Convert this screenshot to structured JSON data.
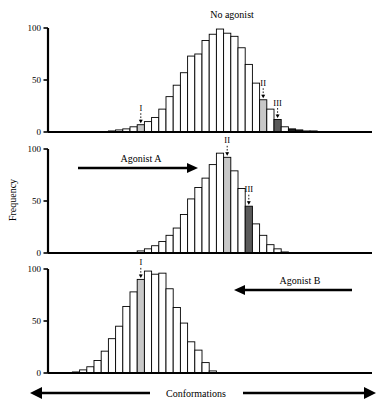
{
  "figure": {
    "yaxis_label": "Frequency",
    "xaxis_label": "Conformations",
    "ytick_labels": [
      "0",
      "50",
      "100"
    ],
    "ytick_values": [
      0,
      50,
      100
    ],
    "colors": {
      "bar_outline": "#000000",
      "bar_fill": "#ffffff",
      "state_I_fill": "#c8c8c8",
      "state_II_fill": "#c8c8c8",
      "state_III_fill": "#5a5a5a",
      "axis": "#000000"
    }
  },
  "chart_data": [
    {
      "type": "bar",
      "title": "No agonist",
      "panel": 1,
      "xlabel": "Conformations",
      "ylabel": "Frequency",
      "ylim": [
        0,
        100
      ],
      "grid": false,
      "legend": null,
      "bin_index": [
        0,
        1,
        2,
        3,
        4,
        5,
        6,
        7,
        8,
        9,
        10,
        11,
        12,
        13,
        14,
        15,
        16,
        17,
        18,
        19,
        20,
        21,
        22,
        23,
        24,
        25,
        26,
        27,
        28,
        29,
        30,
        31
      ],
      "values": [
        0,
        0,
        0,
        0,
        0,
        0,
        0,
        1,
        2,
        3,
        5,
        7,
        10,
        14,
        22,
        34,
        45,
        57,
        73,
        75,
        88,
        94,
        99,
        95,
        92,
        81,
        65,
        47,
        31,
        22,
        12,
        5
      ],
      "annotations": [
        {
          "label": "I",
          "bin": 11,
          "state": "I",
          "fill": "#c8c8c8"
        },
        {
          "label": "II",
          "bin": 28,
          "state": "II",
          "fill": "#c8c8c8"
        },
        {
          "label": "III",
          "bin": 30,
          "state": "III",
          "fill": "#5a5a5a"
        }
      ],
      "tail_values": [
        3,
        2,
        1,
        1,
        0
      ]
    },
    {
      "type": "bar",
      "title": "Agonist A",
      "panel": 2,
      "arrow": "right",
      "arrow_label": "Agonist A",
      "xlabel": "Conformations",
      "ylabel": "Frequency",
      "ylim": [
        0,
        100
      ],
      "grid": false,
      "bin_index": [
        0,
        1,
        2,
        3,
        4,
        5,
        6,
        7,
        8,
        9,
        10,
        11,
        12,
        13,
        14,
        15,
        16,
        17,
        18,
        19,
        20,
        21,
        22,
        23,
        24,
        25,
        26,
        27,
        28,
        29,
        30,
        31
      ],
      "values": [
        0,
        0,
        0,
        0,
        0,
        0,
        0,
        0,
        0,
        0,
        0,
        2,
        4,
        7,
        11,
        17,
        24,
        37,
        52,
        63,
        72,
        85,
        96,
        92,
        79,
        62,
        45,
        28,
        17,
        8,
        4,
        1
      ],
      "annotations": [
        {
          "label": "II",
          "bin": 23,
          "state": "II",
          "fill": "#c8c8c8"
        },
        {
          "label": "III",
          "bin": 26,
          "state": "III",
          "fill": "#5a5a5a"
        }
      ]
    },
    {
      "type": "bar",
      "title": "Agonist B",
      "panel": 3,
      "arrow": "left",
      "arrow_label": "Agonist B",
      "xlabel": "Conformations",
      "ylabel": "Frequency",
      "ylim": [
        0,
        100
      ],
      "grid": false,
      "bin_index": [
        0,
        1,
        2,
        3,
        4,
        5,
        6,
        7,
        8,
        9,
        10,
        11,
        12,
        13,
        14,
        15,
        16,
        17,
        18,
        19,
        20,
        21,
        22,
        23,
        24,
        25,
        26,
        27,
        28,
        29,
        30,
        31
      ],
      "values": [
        0,
        0,
        1,
        3,
        6,
        12,
        21,
        33,
        45,
        64,
        78,
        90,
        98,
        95,
        96,
        81,
        63,
        48,
        30,
        22,
        10,
        2,
        0,
        0,
        0,
        0,
        0,
        0,
        0,
        0,
        0,
        0
      ],
      "annotations": [
        {
          "label": "I",
          "bin": 11,
          "state": "I",
          "fill": "#c8c8c8"
        }
      ]
    }
  ]
}
